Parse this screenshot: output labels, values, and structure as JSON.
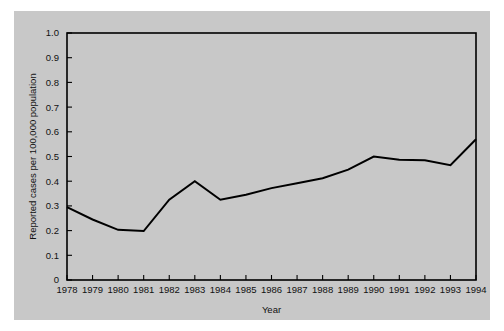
{
  "figure": {
    "background_color": "#c8c8c8",
    "outer_background_color": "#ffffff",
    "line_color": "#000000"
  },
  "chart_data": {
    "type": "line",
    "title": "",
    "xlabel": "Year",
    "ylabel": "Reported cases per 100,000 population",
    "xlim": [
      1978,
      1994
    ],
    "ylim": [
      0,
      1.0
    ],
    "grid": false,
    "legend": "none",
    "categories": [
      "1978",
      "1979",
      "1980",
      "1981",
      "1982",
      "1983",
      "1984",
      "1985",
      "1986",
      "1987",
      "1988",
      "1989",
      "1990",
      "1991",
      "1992",
      "1993",
      "1994"
    ],
    "x": [
      1978,
      1979,
      1980,
      1981,
      1982,
      1983,
      1984,
      1985,
      1986,
      1987,
      1988,
      1989,
      1990,
      1991,
      1992,
      1993,
      1994
    ],
    "values": [
      0.295,
      0.245,
      0.203,
      0.198,
      0.325,
      0.4,
      0.325,
      0.345,
      0.372,
      0.392,
      0.412,
      0.447,
      0.5,
      0.487,
      0.485,
      0.465,
      0.57
    ],
    "ytick_labels": [
      "0",
      "0.1",
      "0.2",
      "0.3",
      "0.4",
      "0.5",
      "0.6",
      "0.7",
      "0.8",
      "0.9",
      "1.0"
    ],
    "ytick_values": [
      0,
      0.1,
      0.2,
      0.3,
      0.4,
      0.5,
      0.6,
      0.7,
      0.8,
      0.9,
      1.0
    ],
    "xtick_labels": [
      "1978",
      "1979",
      "1980",
      "1981",
      "1982",
      "1983",
      "1984",
      "1985",
      "1986",
      "1987",
      "1988",
      "1989",
      "1990",
      "1991",
      "1992",
      "1993",
      "1994"
    ]
  }
}
